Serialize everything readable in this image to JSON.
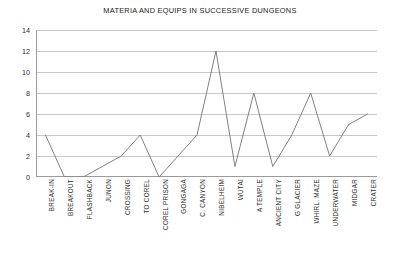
{
  "chart_data": {
    "type": "line",
    "title": "MATERIA AND EQUIPS IN SUCCESSIVE DUNGEONS",
    "xlabel": "",
    "ylabel": "",
    "ylim": [
      0,
      14
    ],
    "ytick_step": 2,
    "yticks": [
      14,
      12,
      10,
      8,
      6,
      4,
      2,
      0
    ],
    "grid": true,
    "grid_axis": "y",
    "legend": false,
    "legend_position": "none",
    "line_color": "#808080",
    "grid_color": "#c8c8c8",
    "axis_color": "#9a9a9a",
    "categories": [
      "BREAK-IN",
      "BREAKOUT",
      "FLASHBACK",
      "JUNON",
      "CROSSING",
      "TO COREL",
      "COREL PRISON",
      "GONGAGA",
      "C. CANYON",
      "NIBELHEIM",
      "WUTAI",
      "A TEMPLE",
      "ANCIENT CITY",
      "G GLACIER",
      "WHIRL. MAZE",
      "UNDERWATER",
      "MIDGAR",
      "CRATER"
    ],
    "values": [
      4,
      0,
      0,
      1,
      2,
      4,
      0,
      2,
      4,
      12,
      1,
      8,
      1,
      4,
      8,
      2,
      5,
      6
    ]
  }
}
